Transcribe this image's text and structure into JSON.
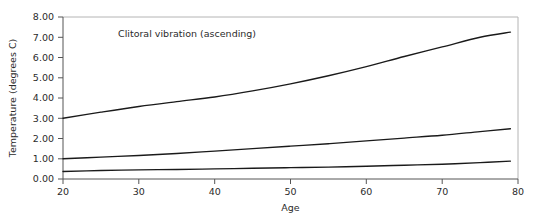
{
  "chart_data": {
    "type": "line",
    "title": "",
    "annotation": "Clitoral vibration (ascending)",
    "xlabel": "Age",
    "ylabel": "Temperature (degrees C)",
    "xlim": [
      20,
      80
    ],
    "ylim": [
      0,
      8
    ],
    "xticks": [
      20,
      30,
      40,
      50,
      60,
      70,
      80
    ],
    "xtick_labels": [
      "20",
      "30",
      "40",
      "50",
      "60",
      "70",
      "80"
    ],
    "yticks": [
      0,
      1,
      2,
      3,
      4,
      5,
      6,
      7,
      8
    ],
    "ytick_labels": [
      "0.00",
      "1.00",
      "2.00",
      "3.00",
      "4.00",
      "5.00",
      "6.00",
      "7.00",
      "8.00"
    ],
    "grid": false,
    "legend": "none",
    "line_color": "#1a1a1a",
    "frame_color": "#b4b4b4",
    "axis_color": "#555555",
    "background": "#ffffff",
    "x": [
      20,
      25,
      30,
      35,
      40,
      45,
      50,
      55,
      60,
      65,
      70,
      75,
      79
    ],
    "series": [
      {
        "name": "upper",
        "values": [
          3.0,
          3.3,
          3.58,
          3.82,
          4.05,
          4.35,
          4.7,
          5.1,
          5.55,
          6.05,
          6.52,
          7.0,
          7.25
        ]
      },
      {
        "name": "middle",
        "values": [
          1.0,
          1.08,
          1.16,
          1.26,
          1.38,
          1.5,
          1.62,
          1.74,
          1.88,
          2.02,
          2.16,
          2.34,
          2.48
        ]
      },
      {
        "name": "lower",
        "values": [
          0.37,
          0.42,
          0.45,
          0.47,
          0.5,
          0.53,
          0.56,
          0.59,
          0.63,
          0.68,
          0.73,
          0.81,
          0.88
        ]
      }
    ]
  }
}
